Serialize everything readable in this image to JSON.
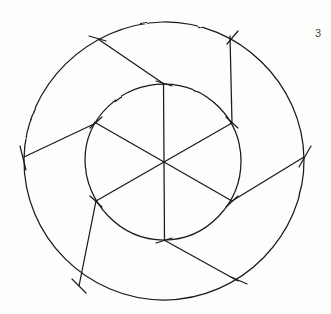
{
  "figure": {
    "number_label": "3",
    "caption": "",
    "background_color": "#fdfdfc",
    "ink_color": "#1a1a1a",
    "style": "hand-drawn pencil line art",
    "stroke_width": 1.15
  },
  "geometry": {
    "center": {
      "x": 164,
      "y": 162
    },
    "outer_circle": {
      "name": "outer-circle",
      "cx": 164,
      "cy": 162,
      "r": 140,
      "stroke": "#1a1a1a"
    },
    "inner_circle": {
      "name": "inner-circle",
      "cx": 164,
      "cy": 162,
      "r": 78,
      "stroke": "#1a1a1a"
    },
    "inner_vertices": [
      {
        "id": "inner-vertex-top",
        "angle_deg": -90,
        "x": 164,
        "y": 84
      },
      {
        "id": "inner-vertex-upper-right",
        "angle_deg": -30,
        "x": 232,
        "y": 123
      },
      {
        "id": "inner-vertex-lower-right",
        "angle_deg": 30,
        "x": 232,
        "y": 201
      },
      {
        "id": "inner-vertex-bottom",
        "angle_deg": 90,
        "x": 164,
        "y": 240
      },
      {
        "id": "inner-vertex-lower-left",
        "angle_deg": 150,
        "x": 96,
        "y": 201
      },
      {
        "id": "inner-vertex-upper-left",
        "angle_deg": -150,
        "x": 96,
        "y": 123
      }
    ],
    "outer_vertices": [
      {
        "id": "outer-vertex-top-left",
        "angle_deg": -118,
        "x": 98,
        "y": 39
      },
      {
        "id": "outer-vertex-top-right",
        "angle_deg": -62,
        "x": 230,
        "y": 36
      },
      {
        "id": "outer-vertex-right",
        "angle_deg": -2,
        "x": 304,
        "y": 157
      },
      {
        "id": "outer-vertex-bottom-right",
        "angle_deg": 58,
        "x": 238,
        "y": 281
      },
      {
        "id": "outer-vertex-bottom-left",
        "angle_deg": 118,
        "x": 79,
        "y": 286
      },
      {
        "id": "outer-vertex-left",
        "angle_deg": 178,
        "x": 24,
        "y": 157
      }
    ],
    "diameters": [
      {
        "id": "diameter-vertical",
        "from": "inner-vertex-top",
        "to": "inner-vertex-bottom"
      },
      {
        "id": "diameter-ne-sw",
        "from": "inner-vertex-upper-right",
        "to": "inner-vertex-lower-left"
      },
      {
        "id": "diameter-nw-se",
        "from": "inner-vertex-upper-left",
        "to": "inner-vertex-lower-right"
      }
    ],
    "spokes": [
      {
        "id": "spoke-1",
        "from": "inner-vertex-top",
        "to": "outer-vertex-top-left"
      },
      {
        "id": "spoke-2",
        "from": "inner-vertex-upper-right",
        "to": "outer-vertex-top-right"
      },
      {
        "id": "spoke-3",
        "from": "inner-vertex-lower-right",
        "to": "outer-vertex-right"
      },
      {
        "id": "spoke-4",
        "from": "inner-vertex-bottom",
        "to": "outer-vertex-bottom-right"
      },
      {
        "id": "spoke-5",
        "from": "inner-vertex-lower-left",
        "to": "outer-vertex-bottom-left"
      },
      {
        "id": "spoke-6",
        "from": "inner-vertex-upper-left",
        "to": "outer-vertex-left"
      }
    ],
    "tick_marks": {
      "description": "short construction cross-strokes at each inner and outer vertex",
      "length": 13,
      "count": 12
    }
  }
}
